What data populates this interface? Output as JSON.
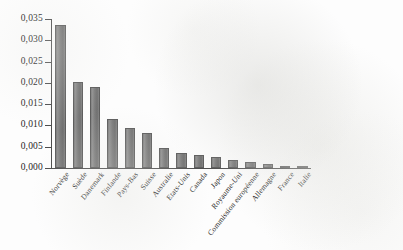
{
  "chart_data": {
    "type": "bar",
    "title": "",
    "subtitle": "",
    "xlabel": "",
    "ylabel": "",
    "categories": [
      "Norvège",
      "Suède",
      "Danemark",
      "Finlande",
      "Pays-Bas",
      "Suisse",
      "Australie",
      "Etats-Unis",
      "Canada",
      "Japon",
      "Royaume-Uni",
      "Commission européenne",
      "Allemagne",
      "France",
      "Italie"
    ],
    "values": [
      0.0335,
      0.0202,
      0.019,
      0.0115,
      0.0095,
      0.0082,
      0.0048,
      0.0036,
      0.003,
      0.0026,
      0.0019,
      0.0013,
      0.001,
      0.0005,
      0.0003
    ],
    "ylim": [
      0,
      0.035
    ],
    "ytick_labels": [
      "0,000",
      "0,005",
      "0,010",
      "0,015",
      "0,020",
      "0,025",
      "0,030",
      "0,035"
    ],
    "ytick_values": [
      0,
      0.005,
      0.01,
      0.015,
      0.02,
      0.025,
      0.03,
      0.035
    ],
    "grid": false,
    "legend": null,
    "legend_position": "none",
    "bar_color": "#7d7d7d",
    "axis_color": "#4a4a4a",
    "background_color": "#fdfdfd",
    "decimal_separator": ","
  }
}
